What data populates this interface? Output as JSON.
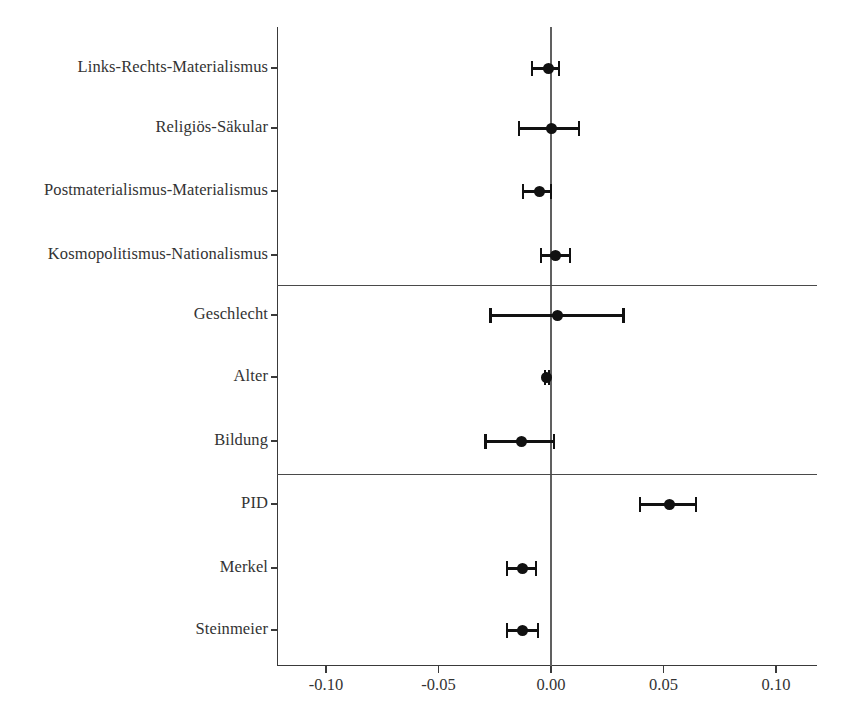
{
  "chart_data": {
    "type": "scatter",
    "subtype": "coefficient-forest-plot",
    "title": "",
    "subtitle": "",
    "xlabel": "",
    "ylabel": "",
    "xlim": [
      -0.125,
      0.12
    ],
    "xticks": [
      -0.1,
      -0.05,
      0.0,
      0.05,
      0.1
    ],
    "xtick_labels": [
      "-0.10",
      "-0.05",
      "0.00",
      "0.05",
      "0.10"
    ],
    "grid": false,
    "legend": null,
    "zero_reference_line": 0.0,
    "point_color": "#111111",
    "line_color": "#111111",
    "axis_color": "#3a3a3a",
    "orientation": "horizontal",
    "categories": [
      "Links-Rechts-Materialismus",
      "Religiös-Säkular",
      "Postmaterialismus-Materialismus",
      "Kosmopolitismus-Nationalismus",
      "Geschlecht",
      "Alter",
      "Bildung",
      "PID",
      "Merkel",
      "Steinmeier"
    ],
    "estimates": [
      -0.0013,
      0.0,
      -0.0053,
      0.0018,
      0.0031,
      -0.0018,
      -0.013,
      0.0525,
      -0.0125,
      -0.0125
    ],
    "ci_low": [
      -0.0085,
      -0.0143,
      -0.0125,
      -0.0045,
      -0.0268,
      -0.0027,
      -0.029,
      0.0396,
      -0.0196,
      -0.0196
    ],
    "ci_high": [
      0.0036,
      0.0125,
      0.0,
      0.0085,
      0.0321,
      -0.0009,
      0.0013,
      0.0645,
      -0.0067,
      -0.0058
    ],
    "group_separators_after": [
      3,
      6
    ],
    "groups": [
      {
        "name": "",
        "categories": [
          "Links-Rechts-Materialismus",
          "Religiös-Säkular",
          "Postmaterialismus-Materialismus",
          "Kosmopolitismus-Nationalismus"
        ]
      },
      {
        "name": "",
        "categories": [
          "Geschlecht",
          "Alter",
          "Bildung"
        ]
      },
      {
        "name": "",
        "categories": [
          "PID",
          "Merkel",
          "Steinmeier"
        ]
      }
    ]
  },
  "axis": {
    "y_labels": [
      "Links-Rechts-Materialismus",
      "Religiös-Säkular",
      "Postmaterialismus-Materialismus",
      "Kosmopolitismus-Nationalismus",
      "Geschlecht",
      "Alter",
      "Bildung",
      "PID",
      "Merkel",
      "Steinmeier"
    ],
    "x_labels": [
      "-0.10",
      "-0.05",
      "0.00",
      "0.05",
      "0.10"
    ]
  }
}
